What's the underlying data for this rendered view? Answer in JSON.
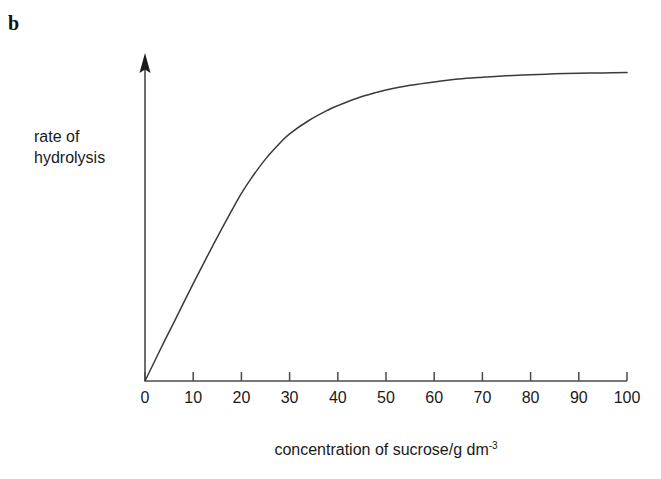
{
  "figure": {
    "part_label": "b",
    "background_color": "#ffffff",
    "line_color": "#3a3a3a",
    "axis_color": "#4a4a4a",
    "text_color": "#1a1a1a"
  },
  "chart_data": {
    "type": "line",
    "title": "",
    "subtitle": "",
    "xlabel": "concentration of sucrose/g dm",
    "xlabel_superscript": "-3",
    "xlabel_full": "concentration of sucrose/g dm⁻³",
    "ylabel": "rate of\nhydrolysis",
    "ylabel_line1": "rate of",
    "ylabel_line2": "hydrolysis",
    "xlim": [
      0,
      100
    ],
    "ylim": [
      0,
      1.08
    ],
    "xticks": [
      0,
      10,
      20,
      30,
      40,
      50,
      60,
      70,
      80,
      90,
      100
    ],
    "xtick_labels": [
      "0",
      "10",
      "20",
      "30",
      "40",
      "50",
      "60",
      "70",
      "80",
      "90",
      "100"
    ],
    "yticks": [],
    "ytick_labels": [],
    "grid": false,
    "legend": null,
    "y_axis_arrow": true,
    "x_axis_arrow": false,
    "series": [
      {
        "name": "rate of hydrolysis vs sucrose concentration",
        "x": [
          0,
          2,
          4,
          6,
          8,
          10,
          12,
          14,
          16,
          18,
          20,
          22,
          25,
          28,
          30,
          34,
          38,
          40,
          44,
          48,
          50,
          55,
          60,
          65,
          70,
          75,
          78,
          80,
          85,
          90,
          95,
          100
        ],
        "y": [
          0.0,
          0.064,
          0.128,
          0.19,
          0.253,
          0.315,
          0.376,
          0.436,
          0.495,
          0.552,
          0.607,
          0.655,
          0.718,
          0.77,
          0.8,
          0.843,
          0.877,
          0.891,
          0.915,
          0.934,
          0.942,
          0.957,
          0.968,
          0.977,
          0.983,
          0.988,
          0.99,
          0.991,
          0.994,
          0.996,
          0.997,
          0.998
        ]
      }
    ],
    "annotations": [
      {
        "text": "curve rises steeply and linearly from origin, bends at about 20 g dm-3, then saturates to a plateau beyond about 78 g dm-3",
        "visible": false
      }
    ]
  }
}
